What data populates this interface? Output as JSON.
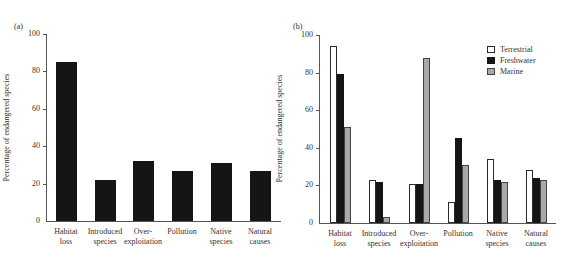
{
  "chart_data": [
    {
      "panel": "(a)",
      "type": "bar",
      "title": "",
      "xlabel": "",
      "ylabel": "Percentage of endangered species",
      "ylim": [
        0,
        100
      ],
      "yticks": [
        0,
        20,
        40,
        60,
        80,
        100
      ],
      "grid": false,
      "categories": [
        "Habitat loss",
        "Introduced species",
        "Over-exploitation",
        "Pollution",
        "Native species",
        "Natural causes"
      ],
      "category_lines": [
        [
          "Habitat",
          "loss"
        ],
        [
          "Introduced",
          "species"
        ],
        [
          "Over-",
          "exploitation"
        ],
        [
          "Pollution",
          ""
        ],
        [
          "Native",
          "species"
        ],
        [
          "Natural",
          "causes"
        ]
      ],
      "values": [
        85,
        22,
        32,
        27,
        31,
        27
      ],
      "bar_color": "#151515"
    },
    {
      "panel": "(b)",
      "type": "bar",
      "title": "",
      "xlabel": "",
      "ylabel": "Percentage of endangered species",
      "ylim": [
        0,
        100
      ],
      "yticks": [
        0,
        20,
        40,
        60,
        80,
        100
      ],
      "grid": false,
      "legend_position": "upper right",
      "categories": [
        "Habitat loss",
        "Introduced species",
        "Over-exploitation",
        "Pollution",
        "Native species",
        "Natural causes"
      ],
      "category_lines": [
        [
          "Habitat",
          "loss"
        ],
        [
          "Introduced",
          "species"
        ],
        [
          "Over-",
          "exploitation"
        ],
        [
          "Pollution",
          ""
        ],
        [
          "Native",
          "species"
        ],
        [
          "Natural",
          "causes"
        ]
      ],
      "series": [
        {
          "name": "Terrestrial",
          "color": "#ffffff",
          "values": [
            94,
            23,
            21,
            11,
            34,
            28
          ]
        },
        {
          "name": "Freshwater",
          "color": "#151515",
          "values": [
            79,
            22,
            21,
            45,
            23,
            24
          ]
        },
        {
          "name": "Marine",
          "color": "#a9a9a9",
          "values": [
            51,
            3,
            88,
            31,
            22,
            23
          ]
        }
      ]
    }
  ]
}
